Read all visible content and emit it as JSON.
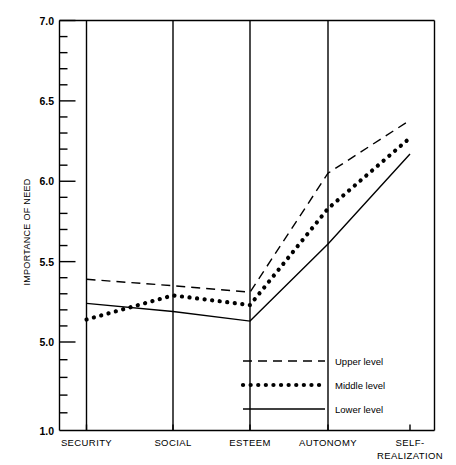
{
  "chart_data": {
    "type": "line",
    "title": "",
    "xlabel": "",
    "ylabel": "IMPORTANCE OF NEED",
    "categories": [
      "SECURITY",
      "SOCIAL",
      "ESTEEM",
      "AUTONOMY",
      "SELF-REALIZATION"
    ],
    "category_labels_multiline": [
      [
        "SECURITY"
      ],
      [
        "SOCIAL"
      ],
      [
        "ESTEEM"
      ],
      [
        "AUTONOMY"
      ],
      [
        "SELF-",
        "REALIZATION"
      ]
    ],
    "ytick_labels": [
      "7.0",
      "6.5",
      "6.0",
      "5.5",
      "5.0",
      "1.0"
    ],
    "ytick_values": [
      7.0,
      6.5,
      6.0,
      5.5,
      5.0,
      1.0
    ],
    "ylim": [
      1.0,
      7.0
    ],
    "axis_broken": true,
    "axis_break_note": "axis compressed below 5.0; baseline labelled 1.0",
    "minor_ticks_per_major": 5,
    "grid": false,
    "vertical_category_rules": true,
    "legend_position": "inside-lower-right",
    "series": [
      {
        "name": "Upper level",
        "style": "dashed",
        "values": [
          5.39,
          5.35,
          5.31,
          6.05,
          6.38
        ]
      },
      {
        "name": "Middle level",
        "style": "dotted",
        "values": [
          5.14,
          5.29,
          5.23,
          5.83,
          6.27
        ]
      },
      {
        "name": "Lower level",
        "style": "solid",
        "values": [
          5.24,
          5.19,
          5.13,
          5.61,
          6.17
        ]
      }
    ]
  },
  "legend": {
    "entries": [
      {
        "label": "Upper level",
        "style": "dashed"
      },
      {
        "label": "Middle level",
        "style": "dotted"
      },
      {
        "label": "Lower level",
        "style": "solid"
      }
    ]
  },
  "colors": {
    "ink": "#000000",
    "background": "#ffffff"
  }
}
